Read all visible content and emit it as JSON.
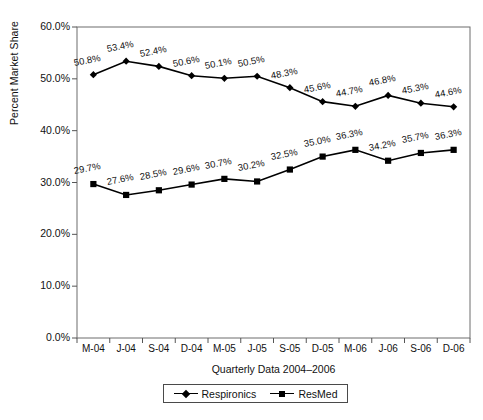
{
  "chart_data": {
    "type": "line",
    "title": "",
    "xlabel": "Quarterly Data 2004–2006",
    "ylabel": "Percent Market Share",
    "categories": [
      "M-04",
      "J-04",
      "S-04",
      "D-04",
      "M-05",
      "J-05",
      "S-05",
      "D-05",
      "M-06",
      "J-06",
      "S-06",
      "D-06"
    ],
    "ylim": [
      0,
      60
    ],
    "ytick_labels": [
      "0.0%",
      "10.0%",
      "20.0%",
      "30.0%",
      "40.0%",
      "50.0%",
      "60.0%"
    ],
    "ytick_values": [
      0,
      10,
      20,
      30,
      40,
      50,
      60
    ],
    "grid": false,
    "legend_position": "bottom",
    "series": [
      {
        "name": "Respironics",
        "marker": "diamond",
        "color": "#000000",
        "values": [
          50.8,
          53.4,
          52.4,
          50.6,
          50.1,
          50.5,
          48.3,
          45.6,
          44.7,
          46.8,
          45.3,
          44.6
        ],
        "labels": [
          "50.8%",
          "53.4%",
          "52.4%",
          "50.6%",
          "50.1%",
          "50.5%",
          "48.3%",
          "45.6%",
          "44.7%",
          "46.8%",
          "45.3%",
          "44.6%"
        ]
      },
      {
        "name": "ResMed",
        "marker": "square",
        "color": "#000000",
        "values": [
          29.7,
          27.6,
          28.5,
          29.6,
          30.7,
          30.2,
          32.5,
          35.0,
          36.3,
          34.2,
          35.7,
          36.3
        ],
        "labels": [
          "29.7%",
          "27.6%",
          "28.5%",
          "29.6%",
          "30.7%",
          "30.2%",
          "32.5%",
          "35.0%",
          "36.3%",
          "34.2%",
          "35.7%",
          "36.3%"
        ]
      }
    ]
  }
}
